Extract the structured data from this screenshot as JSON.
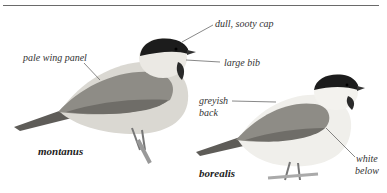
{
  "plate": {
    "birds": [
      {
        "subspecies": "montanus",
        "callouts": [
          "pale wing panel",
          "dull, sooty cap",
          "large bib"
        ]
      },
      {
        "subspecies": "borealis",
        "callouts": [
          "greyish back",
          "white below"
        ]
      }
    ],
    "labels": {
      "pale_wing_panel": "pale wing panel",
      "dull_sooty_cap": "dull, sooty cap",
      "large_bib": "large bib",
      "greyish_1": "greyish",
      "greyish_2": "back",
      "white_1": "white",
      "white_2": "below",
      "montanus": "montanus",
      "borealis": "borealis"
    },
    "colors": {
      "cap": "#1c1c1c",
      "back": "#8e8c86",
      "wing": "#6f6d68",
      "belly": "#e4e2dc",
      "rule": "#6a6a6a",
      "leader": "#555555"
    }
  }
}
